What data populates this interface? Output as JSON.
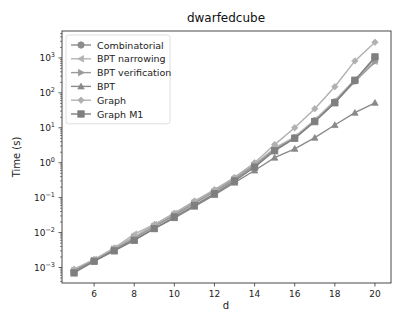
{
  "chart_data": {
    "type": "line",
    "title": "dwarfedcube",
    "xlabel": "d",
    "ylabel": "Time (s)",
    "yscale": "log",
    "xlim": [
      4.4,
      20.8
    ],
    "ylim": [
      0.00036,
      5900
    ],
    "xticks": [
      6,
      8,
      10,
      12,
      14,
      16,
      18,
      20
    ],
    "yticks": [
      {
        "value": 0.001,
        "label": "10^-3"
      },
      {
        "value": 0.01,
        "label": "10^-2"
      },
      {
        "value": 0.1,
        "label": "10^-1"
      },
      {
        "value": 1,
        "label": "10^0"
      },
      {
        "value": 10,
        "label": "10^1"
      },
      {
        "value": 100,
        "label": "10^2"
      },
      {
        "value": 1000,
        "label": "10^3"
      }
    ],
    "grid": false,
    "legend_position": "upper left",
    "x": [
      5,
      6,
      7,
      8,
      9,
      10,
      11,
      12,
      13,
      14,
      15,
      16,
      17,
      18,
      19,
      20
    ],
    "series": [
      {
        "name": "Combinatorial",
        "marker": "circle",
        "color": "#8c8c8c",
        "values": [
          0.0008,
          0.0016,
          0.0033,
          0.0068,
          0.015,
          0.031,
          0.07,
          0.15,
          0.33,
          0.85,
          2.4,
          5.2,
          16,
          55,
          220,
          1000
        ]
      },
      {
        "name": "BPT narrowing",
        "marker": "triangle-left",
        "color": "#b4b4b4",
        "values": [
          0.0008,
          0.0017,
          0.0036,
          0.009,
          0.017,
          0.035,
          0.075,
          0.16,
          0.36,
          0.9,
          2.6,
          5.5,
          17,
          60,
          240,
          800
        ]
      },
      {
        "name": "BPT verification",
        "marker": "triangle-right",
        "color": "#9a9a9a",
        "values": [
          0.0008,
          0.0016,
          0.0034,
          0.007,
          0.015,
          0.032,
          0.07,
          0.15,
          0.34,
          0.85,
          2.4,
          5.0,
          15,
          52,
          210,
          770
        ]
      },
      {
        "name": "BPT",
        "marker": "triangle-up",
        "color": "#8a8a8a",
        "values": [
          0.0008,
          0.0016,
          0.0032,
          0.0062,
          0.013,
          0.026,
          0.055,
          0.12,
          0.27,
          0.6,
          1.4,
          2.5,
          5.2,
          12,
          27,
          52
        ]
      },
      {
        "name": "Graph",
        "marker": "plus",
        "color": "#b0b0b0",
        "values": [
          0.0009,
          0.0017,
          0.0036,
          0.0075,
          0.017,
          0.036,
          0.08,
          0.17,
          0.38,
          1.0,
          3.3,
          10,
          35,
          150,
          820,
          2800
        ]
      },
      {
        "name": "Graph M1",
        "marker": "square",
        "color": "#7f7f7f",
        "values": [
          0.0007,
          0.0015,
          0.003,
          0.006,
          0.013,
          0.028,
          0.06,
          0.13,
          0.3,
          0.75,
          2.2,
          5.0,
          15,
          52,
          230,
          1070
        ]
      }
    ]
  },
  "layout": {
    "plot_left": 62,
    "plot_top": 31,
    "plot_right": 391,
    "plot_bottom": 283
  }
}
